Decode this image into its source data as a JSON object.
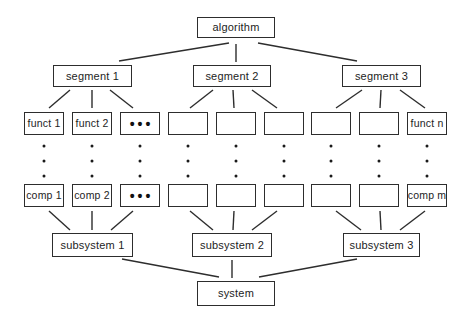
{
  "diagram": {
    "root": {
      "label": "algorithm"
    },
    "segments": [
      {
        "label": "segment 1"
      },
      {
        "label": "segment 2"
      },
      {
        "label": "segment 3"
      }
    ],
    "funct_row": [
      "funct 1",
      "funct 2",
      "•••",
      "",
      "",
      "",
      "",
      "",
      "funct n"
    ],
    "comp_row": [
      "comp 1",
      "comp 2",
      "•••",
      "",
      "",
      "",
      "",
      "",
      "comp m"
    ],
    "subsystems": [
      {
        "label": "subsystem 1"
      },
      {
        "label": "subsystem 2"
      },
      {
        "label": "subsystem 3"
      }
    ],
    "system": {
      "label": "system"
    },
    "colors": {
      "background": "#ffffff",
      "box_border": "#2d2d2d",
      "line": "#2d2d2d",
      "text": "#1d1d1d"
    }
  }
}
